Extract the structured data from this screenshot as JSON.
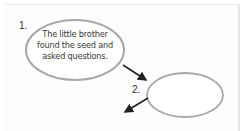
{
  "diagram": {
    "type": "sequence-of-events",
    "steps": [
      {
        "number": "1.",
        "text_lines": [
          "The little brother",
          "found the seed and",
          "asked questions."
        ]
      },
      {
        "number": "2.",
        "text_lines": []
      }
    ],
    "colors": {
      "outline": "#a8a8a8",
      "arrow": "#222222",
      "text": "#3a3a3a"
    }
  }
}
